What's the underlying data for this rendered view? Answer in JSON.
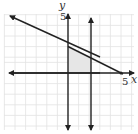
{
  "graph": {
    "x_axis_label": "x",
    "y_axis_label": "y",
    "x_tick_label": "5",
    "y_tick_label": "5",
    "x_range": [
      -6,
      6
    ],
    "y_range": [
      -5,
      6
    ],
    "grid": true,
    "lines": [
      {
        "name": "boundary line",
        "equation": "x + 2y = 5",
        "points": [
          [
            -6,
            5.5
          ],
          [
            5,
            0
          ]
        ]
      },
      {
        "name": "vertical line x=0",
        "equation": "x = 0"
      },
      {
        "name": "vertical line x=2",
        "equation": "x = 2"
      }
    ],
    "shaded_region": {
      "description": "feasible region bounded by x=0, x=2, y=0 and x+2y=5",
      "vertices": [
        [
          0,
          0
        ],
        [
          2,
          0
        ],
        [
          2,
          1.5
        ],
        [
          0,
          2.5
        ]
      ],
      "color": "#e6e6e6"
    },
    "colors": {
      "axis": "#222222",
      "grid": "#dddddd",
      "line": "#222222"
    }
  }
}
